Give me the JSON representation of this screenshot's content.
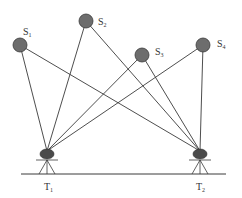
{
  "diagram": {
    "type": "two-station observation geometry",
    "sources": [
      {
        "id": "S1",
        "letter": "S",
        "sub": "1",
        "x": 20,
        "y": 45,
        "label_x": 23,
        "label_y": 35
      },
      {
        "id": "S2",
        "letter": "S",
        "sub": "2",
        "x": 86,
        "y": 21,
        "label_x": 98,
        "label_y": 25
      },
      {
        "id": "S3",
        "letter": "S",
        "sub": "3",
        "x": 142,
        "y": 55,
        "label_x": 155,
        "label_y": 55
      },
      {
        "id": "S4",
        "letter": "S",
        "sub": "4",
        "x": 203,
        "y": 45,
        "label_x": 217,
        "label_y": 47
      }
    ],
    "stations": [
      {
        "id": "T1",
        "letter": "T",
        "sub": "1",
        "x": 47,
        "y": 153,
        "label_x": 44,
        "label_y": 190
      },
      {
        "id": "T2",
        "letter": "T",
        "sub": "2",
        "x": 200,
        "y": 153,
        "label_x": 196,
        "label_y": 190
      }
    ],
    "ground": {
      "x1": 21,
      "x2": 226,
      "y": 174
    },
    "source_radius": 7,
    "colors": {
      "source_fill": "#6d6d6d",
      "instrument_fill": "#4a4a4a",
      "line": "#3a3a3a",
      "background": "#ffffff"
    }
  }
}
